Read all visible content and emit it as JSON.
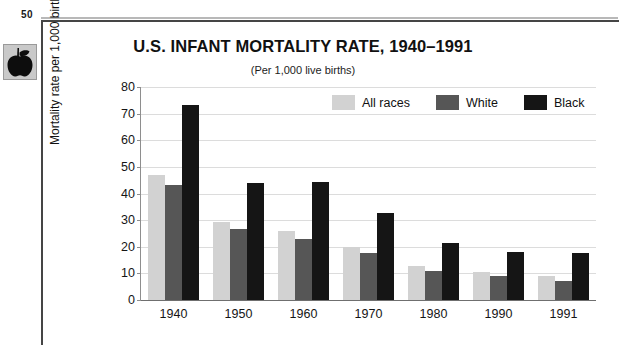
{
  "page": {
    "number": "50",
    "apple_icon": "apple-icon"
  },
  "chart_data": {
    "type": "bar",
    "title": "U.S. INFANT MORTALITY RATE, 1940–1991",
    "subtitle": "(Per 1,000 live births)",
    "xlabel": "",
    "ylabel": "Mortality rate per 1,000 births",
    "ylim": [
      0,
      80
    ],
    "ytick_step": 10,
    "yticks": [
      0,
      10,
      20,
      30,
      40,
      50,
      60,
      70,
      80
    ],
    "grid": true,
    "legend_position": "top-right-inside",
    "categories": [
      "1940",
      "1950",
      "1960",
      "1970",
      "1980",
      "1990",
      "1991"
    ],
    "series": [
      {
        "name": "All races",
        "color": "#d2d2d2",
        "values": [
          47.0,
          29.2,
          26.0,
          20.0,
          12.6,
          10.4,
          8.9
        ]
      },
      {
        "name": "White",
        "color": "#565656",
        "values": [
          43.2,
          26.8,
          22.9,
          17.8,
          11.0,
          8.9,
          7.0
        ]
      },
      {
        "name": "Black",
        "color": "#151515",
        "values": [
          73.2,
          43.9,
          44.3,
          32.6,
          21.4,
          18.0,
          17.6
        ]
      }
    ]
  }
}
